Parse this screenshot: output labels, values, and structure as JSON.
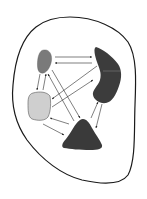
{
  "diagram": {
    "type": "node-link",
    "boundary": {
      "stroke": "#1a1a1a",
      "fill": "#ffffff"
    },
    "nodes": [
      {
        "id": "top-left-oval",
        "shape": "oval",
        "fill": "#7a7a7a"
      },
      {
        "id": "top-right-bean",
        "shape": "kidney",
        "fill": "#3c3c3c"
      },
      {
        "id": "left-square",
        "shape": "rounded-square",
        "fill": "#cfcfcf"
      },
      {
        "id": "bottom-triangle",
        "shape": "triangle-blob",
        "fill": "#3a3a3a"
      }
    ],
    "edges": [
      {
        "from": "top-left-oval",
        "to": "top-right-bean",
        "direction": "bidirectional"
      },
      {
        "from": "top-left-oval",
        "to": "left-square",
        "direction": "bidirectional"
      },
      {
        "from": "top-left-oval",
        "to": "bottom-triangle",
        "direction": "bidirectional"
      },
      {
        "from": "top-right-bean",
        "to": "left-square",
        "direction": "bidirectional"
      },
      {
        "from": "top-right-bean",
        "to": "bottom-triangle",
        "direction": "bidirectional"
      },
      {
        "from": "left-square",
        "to": "bottom-triangle",
        "direction": "bidirectional"
      }
    ],
    "arrow_color": "#2a2a2a"
  }
}
